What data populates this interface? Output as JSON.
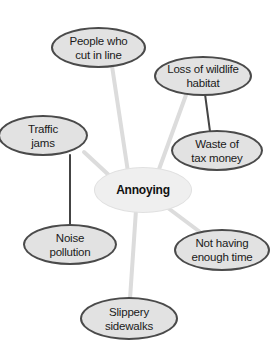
{
  "diagram": {
    "type": "web-organizer",
    "center": {
      "label": "Annoying"
    },
    "nodes": [
      {
        "id": "people",
        "line1": "People who",
        "line2": "cut in line"
      },
      {
        "id": "loss",
        "line1": "Loss of wildlife",
        "line2": "habitat"
      },
      {
        "id": "traffic",
        "line1": "Traffic",
        "line2": "jams"
      },
      {
        "id": "waste",
        "line1": "Waste of",
        "line2": "tax money"
      },
      {
        "id": "noise",
        "line1": "Noise",
        "line2": "pollution"
      },
      {
        "id": "time",
        "line1": "Not having",
        "line2": "enough time"
      },
      {
        "id": "slippery",
        "line1": "Slippery",
        "line2": "sidewalks"
      }
    ],
    "links": [
      {
        "from": "Annoying",
        "to": "People who cut in line",
        "style": "light"
      },
      {
        "from": "Annoying",
        "to": "Loss of wildlife habitat",
        "style": "light"
      },
      {
        "from": "Annoying",
        "to": "Traffic jams",
        "style": "light"
      },
      {
        "from": "Annoying",
        "to": "Not having enough time",
        "style": "light"
      },
      {
        "from": "Annoying",
        "to": "Slippery sidewalks",
        "style": "light"
      },
      {
        "from": "Loss of wildlife habitat",
        "to": "Waste of tax money",
        "style": "dark"
      },
      {
        "from": "Traffic jams",
        "to": "Noise pollution",
        "style": "dark"
      }
    ],
    "colors": {
      "node_fill": "#e2e2e2",
      "node_border": "#4a4a4a",
      "center_fill": "#efefef",
      "light_link": "#dcdcdc",
      "dark_link": "#444444"
    }
  }
}
